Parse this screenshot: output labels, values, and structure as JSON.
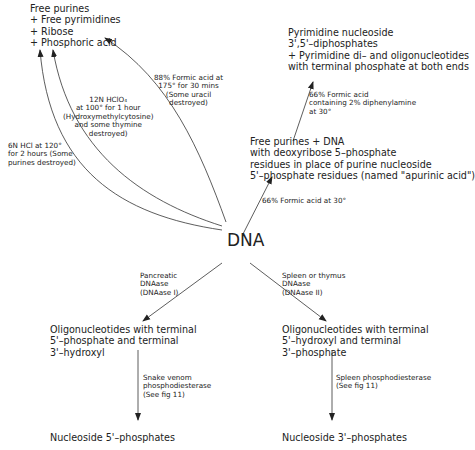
{
  "center": {
    "label": "DNA"
  },
  "products": {
    "acid_hydrolysis": "Free purines\n+ Free pyrimidines\n+ Ribose\n+ Phosphoric acid",
    "pyrimidine": "Pyrimidine nucleoside\n3',5'–diphosphates\n+ Pyrimidine di– and oligonucleotides\nwith terminal phosphate at both ends",
    "apurinic": "Free purines + DNA\nwith deoxyribose 5–phosphate\nresidues in place of purine nucleoside\n5'–phosphate residues (named \"apurinic acid\")",
    "oligo_5p": "Oligonucleotides with terminal\n5'–phosphate and terminal\n3'–hydroxyl",
    "oligo_3p": "Oligonucleotides with terminal\n5'–hydroxyl and terminal\n3'–phosphate",
    "nuc_5p": "Nucleoside 5'–phosphates",
    "nuc_3p": "Nucleoside 3'–phosphates"
  },
  "conditions": {
    "hcl": "6N HCl at 120°\nfor 2 hours (Some\npurines destroyed)",
    "hclo4": "12N HClO₄\nat 100° for 1 hour\n(Hydroxymethylcytosine)\nand some thymine\ndestroyed)",
    "formic88": "88% Formic acid at\n175° for 30 mins\n(Some uracil\ndestroyed)",
    "formic66_dpa": "66% Formic acid\ncontaining 2% diphenylamine\nat 30°",
    "formic66": "66% Formic acid at 30°",
    "dnase1": "Pancreatic\nDNAase\n(DNAase I)",
    "dnase2": "Spleen or thymus\nDNAase\n(DNAase II)",
    "snake": "Snake venom\nphosphodiesterase\n(See fig 11)",
    "spleen": "Spleen phosphodiesterase\n(See fig 11)"
  }
}
